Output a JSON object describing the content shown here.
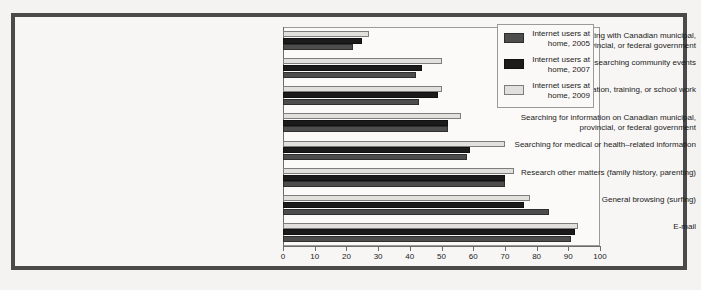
{
  "chart_data": {
    "type": "bar",
    "orientation": "horizontal",
    "title": "",
    "xlabel": "",
    "ylabel": "",
    "xlim": [
      0,
      100
    ],
    "xticks": [
      0,
      10,
      20,
      30,
      40,
      50,
      60,
      70,
      80,
      90,
      100
    ],
    "grid": false,
    "legend_position": "top-right",
    "categories": [
      "Communicating with Canadian municipal,\nprovincial, or federal government",
      "Researching community events",
      "Education, training, or school work",
      "Searching for information on Canadian municipal,\nprovincial, or federal government",
      "Searching for medical or health–related information",
      "Research other matters (family history, parenting)",
      "General browsing (surfing)",
      "E-mail"
    ],
    "series": [
      {
        "name": "Internet users at\nhome, 2005",
        "key": "s2005",
        "color": "#4d4d4d",
        "values": [
          22,
          42,
          43,
          52,
          58,
          70,
          84,
          91
        ]
      },
      {
        "name": "Internet users at\nhome, 2007",
        "key": "s2007",
        "color": "#1b1b1b",
        "values": [
          25,
          44,
          49,
          52,
          59,
          70,
          76,
          92
        ]
      },
      {
        "name": "Internet users at\nhome, 2009",
        "key": "s2009",
        "color": "#e2e0dc",
        "values": [
          27,
          50,
          50,
          56,
          70,
          73,
          78,
          93
        ]
      }
    ]
  },
  "legend": {
    "entries": [
      {
        "label": "Internet users at\nhome, 2005",
        "key": "s2005"
      },
      {
        "label": "Internet users at\nhome, 2007",
        "key": "s2007"
      },
      {
        "label": "Internet users at\nhome, 2009",
        "key": "s2009"
      }
    ]
  },
  "colors": {
    "frame": "#4a4a4a",
    "panel_background": "#fbfaf8",
    "page_background": "#f4f3f1",
    "axis": "#6b6b6b"
  }
}
